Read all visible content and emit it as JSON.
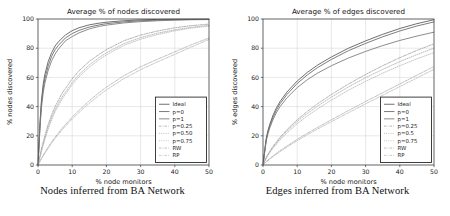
{
  "figure": {
    "panels": [
      {
        "id": "nodes-panel",
        "caption": "Nodes inferred from BA Network",
        "chart_data": {
          "type": "line",
          "title": "Average % of nodes discovered",
          "xlabel": "% node monitors",
          "ylabel": "% nodes discovered",
          "xlim": [
            0,
            50
          ],
          "ylim": [
            0,
            100
          ],
          "xticks": [
            0,
            10,
            20,
            30,
            40,
            50
          ],
          "yticks": [
            0,
            20,
            40,
            60,
            80,
            100
          ],
          "grid": true,
          "legend_position": "lower-right",
          "series": [
            {
              "name": "Ideal",
              "style": "solid",
              "color": "#555555",
              "width": 0.85,
              "x": [
                0,
                0.6,
                1,
                1.5,
                2,
                3,
                4,
                5,
                6,
                8,
                10,
                12,
                15,
                18,
                20,
                25,
                30,
                35,
                40,
                45,
                50
              ],
              "y": [
                0,
                30,
                44,
                55,
                62,
                71,
                77,
                81.5,
                84.5,
                89,
                92,
                94,
                96,
                97.2,
                97.8,
                98.8,
                99.4,
                99.7,
                99.9,
                100,
                100
              ]
            },
            {
              "name": "p=0",
              "style": "solid",
              "color": "#666666",
              "width": 0.85,
              "x": [
                0,
                0.6,
                1,
                1.5,
                2,
                3,
                4,
                5,
                6,
                8,
                10,
                12,
                15,
                18,
                20,
                25,
                30,
                35,
                40,
                45,
                50
              ],
              "y": [
                0,
                28,
                42,
                52,
                59,
                68,
                74.5,
                79,
                82,
                87,
                90,
                92.2,
                94.5,
                96,
                96.8,
                98,
                98.8,
                99.2,
                99.5,
                99.7,
                99.8
              ]
            },
            {
              "name": "p=1",
              "style": "solid",
              "color": "#777777",
              "width": 0.85,
              "x": [
                0,
                0.6,
                1,
                1.5,
                2,
                3,
                4,
                5,
                6,
                8,
                10,
                12,
                15,
                18,
                20,
                25,
                30,
                35,
                40,
                45,
                50
              ],
              "y": [
                0,
                26,
                39,
                49,
                56,
                65,
                71.5,
                76,
                79.5,
                85,
                88,
                90.5,
                93.2,
                95,
                95.8,
                97.3,
                98.2,
                98.8,
                99.2,
                99.5,
                99.6
              ]
            },
            {
              "name": "p=0.25",
              "style": "dashdot",
              "color": "#999999",
              "width": 0.75,
              "x": [
                0,
                1,
                2,
                3,
                4,
                5,
                7,
                10,
                12,
                15,
                18,
                20,
                25,
                30,
                35,
                40,
                45,
                50
              ],
              "y": [
                0,
                11,
                20,
                28,
                34.5,
                40,
                49,
                59,
                64.5,
                71,
                76,
                79,
                85,
                89,
                91.8,
                94,
                95.5,
                96.5
              ]
            },
            {
              "name": "p=0.50",
              "style": "dotted",
              "color": "#a5a5a5",
              "width": 0.75,
              "x": [
                0,
                1,
                2,
                3,
                4,
                5,
                7,
                10,
                12,
                15,
                18,
                20,
                25,
                30,
                35,
                40,
                45,
                50
              ],
              "y": [
                0,
                10,
                18.5,
                26,
                32.5,
                38,
                46.5,
                56.5,
                62,
                68.5,
                73.8,
                76.8,
                83,
                87.3,
                90.3,
                92.6,
                94.4,
                95.6
              ]
            },
            {
              "name": "p=0.75",
              "style": "dotted",
              "color": "#b0b0b0",
              "width": 0.75,
              "x": [
                0,
                1,
                2,
                3,
                4,
                5,
                7,
                10,
                12,
                15,
                18,
                20,
                25,
                30,
                35,
                40,
                45,
                50
              ],
              "y": [
                0,
                9.2,
                17.5,
                24.8,
                31,
                36.5,
                45,
                55,
                60.5,
                67,
                72.3,
                75.4,
                81.8,
                86.2,
                89.4,
                91.9,
                93.8,
                95.2
              ]
            },
            {
              "name": "RW",
              "style": "dashdot",
              "color": "#a8a8a8",
              "width": 0.75,
              "x": [
                0,
                1,
                2,
                3,
                4,
                5,
                7,
                10,
                12,
                15,
                18,
                20,
                25,
                30,
                35,
                40,
                45,
                50
              ],
              "y": [
                0,
                4.5,
                8.5,
                12.3,
                15.8,
                19,
                25,
                32.8,
                37.5,
                44,
                49.8,
                53.3,
                61,
                67.3,
                72.5,
                77.5,
                82.5,
                87
              ]
            },
            {
              "name": "RP",
              "style": "dashdot",
              "color": "#b4b4b4",
              "width": 0.75,
              "x": [
                0,
                1,
                2,
                3,
                4,
                5,
                7,
                10,
                12,
                15,
                18,
                20,
                25,
                30,
                35,
                40,
                45,
                50
              ],
              "y": [
                0,
                4.2,
                8,
                11.6,
                15,
                18.2,
                24,
                31.5,
                36,
                42.3,
                48,
                51.4,
                59,
                65.3,
                70.7,
                75.8,
                81,
                86
              ]
            }
          ]
        }
      },
      {
        "id": "edges-panel",
        "caption": "Edges inferred from BA Network",
        "chart_data": {
          "type": "line",
          "title": "Average % of edges discovered",
          "xlabel": "% node monitors",
          "ylabel": "% edges discovered",
          "xlim": [
            0,
            50
          ],
          "ylim": [
            0,
            100
          ],
          "xticks": [
            0,
            10,
            20,
            30,
            40,
            50
          ],
          "yticks": [
            0,
            20,
            40,
            60,
            80,
            100
          ],
          "grid": true,
          "legend_position": "lower-right",
          "series": [
            {
              "name": "Ideal",
              "style": "solid",
              "color": "#555555",
              "width": 0.85,
              "x": [
                0,
                0.6,
                1,
                1.5,
                2,
                3,
                4,
                5,
                7,
                10,
                13,
                16,
                20,
                25,
                30,
                35,
                40,
                45,
                50
              ],
              "y": [
                0,
                12,
                19,
                24,
                28,
                34.5,
                39.5,
                43.5,
                50,
                57.5,
                63.5,
                68.5,
                74,
                80,
                85,
                89.5,
                93.5,
                96.8,
                99.5
              ]
            },
            {
              "name": "p=0",
              "style": "solid",
              "color": "#666666",
              "width": 0.85,
              "x": [
                0,
                0.6,
                1,
                1.5,
                2,
                3,
                4,
                5,
                7,
                10,
                13,
                16,
                20,
                25,
                30,
                35,
                40,
                45,
                50
              ],
              "y": [
                0,
                11.5,
                18,
                23,
                26.8,
                33,
                38,
                42,
                48.3,
                55.8,
                61.8,
                66.8,
                72.3,
                78.3,
                83.3,
                87.8,
                91.8,
                95.2,
                98
              ]
            },
            {
              "name": "p=1",
              "style": "solid",
              "color": "#777777",
              "width": 0.85,
              "x": [
                0,
                0.6,
                1,
                1.5,
                2,
                3,
                4,
                5,
                7,
                10,
                13,
                16,
                20,
                25,
                30,
                35,
                40,
                45,
                50
              ],
              "y": [
                0,
                10.8,
                17,
                21.8,
                25.5,
                31.5,
                36.2,
                40,
                46,
                53,
                58.5,
                63,
                68,
                73.3,
                77.8,
                81.8,
                85.3,
                88.3,
                91
              ]
            },
            {
              "name": "p=0.25",
              "style": "dashdot",
              "color": "#999999",
              "width": 0.75,
              "x": [
                0,
                1,
                2,
                3,
                5,
                7,
                10,
                13,
                16,
                20,
                25,
                30,
                35,
                40,
                45,
                50
              ],
              "y": [
                0,
                5.5,
                9.5,
                13,
                19,
                24.2,
                31,
                36.8,
                42,
                48.3,
                55.5,
                62,
                68,
                73.5,
                78.5,
                83
              ]
            },
            {
              "name": "p=0.5",
              "style": "dotted",
              "color": "#a5a5a5",
              "width": 0.75,
              "x": [
                0,
                1,
                2,
                3,
                5,
                7,
                10,
                13,
                16,
                20,
                25,
                30,
                35,
                40,
                45,
                50
              ],
              "y": [
                0,
                5.2,
                9,
                12.4,
                18.2,
                23.2,
                29.8,
                35.4,
                40.4,
                46.5,
                53.5,
                59.8,
                65.5,
                70.8,
                75.6,
                80
              ]
            },
            {
              "name": "p=0.75",
              "style": "dotted",
              "color": "#b0b0b0",
              "width": 0.75,
              "x": [
                0,
                1,
                2,
                3,
                5,
                7,
                10,
                13,
                16,
                20,
                25,
                30,
                35,
                40,
                45,
                50
              ],
              "y": [
                0,
                4.9,
                8.5,
                11.7,
                17.2,
                22,
                28.3,
                33.7,
                38.5,
                44.4,
                51.2,
                57.3,
                62.9,
                68,
                72.7,
                77
              ]
            },
            {
              "name": "RW",
              "style": "dashdot",
              "color": "#a8a8a8",
              "width": 0.75,
              "x": [
                0,
                1,
                2,
                3,
                5,
                7,
                10,
                13,
                16,
                20,
                25,
                30,
                35,
                40,
                45,
                50
              ],
              "y": [
                0,
                2.4,
                4.4,
                6.3,
                9.8,
                13,
                17.5,
                21.8,
                25.8,
                31,
                37.3,
                43.5,
                49.5,
                55.5,
                61.5,
                67.5
              ]
            },
            {
              "name": "RP",
              "style": "dashdot",
              "color": "#b4b4b4",
              "width": 0.75,
              "x": [
                0,
                1,
                2,
                3,
                5,
                7,
                10,
                13,
                16,
                20,
                25,
                30,
                35,
                40,
                45,
                50
              ],
              "y": [
                0,
                2.2,
                4.1,
                5.9,
                9.2,
                12.3,
                16.6,
                20.8,
                24.7,
                29.7,
                35.8,
                41.9,
                47.8,
                53.7,
                59.6,
                65.5
              ]
            }
          ]
        }
      }
    ]
  }
}
